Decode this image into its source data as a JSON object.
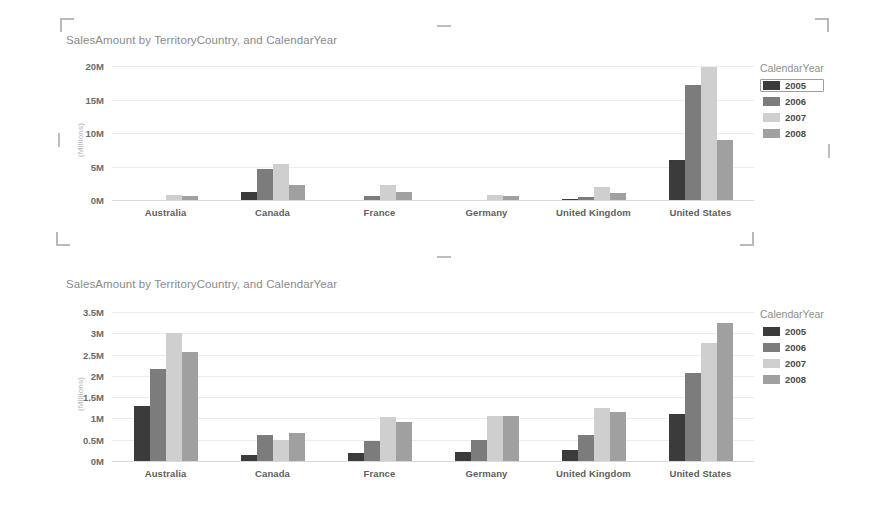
{
  "charts": [
    {
      "id": "top",
      "title": "SalesAmount by TerritoryCountry, and CalendarYear",
      "y_axis_title": "(Millions)",
      "legend_title": "CalendarYear",
      "selected_legend": "2005",
      "chart_data": {
        "type": "bar",
        "title": "SalesAmount by TerritoryCountry, and CalendarYear",
        "xlabel": "",
        "ylabel": "(Millions)",
        "ylim": [
          0,
          20
        ],
        "yticks": [
          "0M",
          "5M",
          "10M",
          "15M",
          "20M"
        ],
        "ytick_values": [
          0,
          5,
          10,
          15,
          20
        ],
        "grid": true,
        "legend_position": "right",
        "categories": [
          "Australia",
          "Canada",
          "France",
          "Germany",
          "United Kingdom",
          "United States"
        ],
        "series": [
          {
            "name": "2005",
            "color": "#3b3b3b",
            "values": [
              0.0,
              1.2,
              0.0,
              0.0,
              0.2,
              6.0
            ]
          },
          {
            "name": "2006",
            "color": "#7c7c7c",
            "values": [
              0.0,
              4.6,
              0.6,
              0.0,
              0.5,
              17.1
            ]
          },
          {
            "name": "2007",
            "color": "#cfcfcf",
            "values": [
              0.7,
              5.4,
              2.2,
              0.8,
              1.9,
              19.9
            ]
          },
          {
            "name": "2008",
            "color": "#a0a0a0",
            "values": [
              0.6,
              2.2,
              1.2,
              0.6,
              1.0,
              8.9
            ]
          }
        ]
      }
    },
    {
      "id": "bottom",
      "title": "SalesAmount by TerritoryCountry, and CalendarYear",
      "y_axis_title": "(Millions)",
      "legend_title": "CalendarYear",
      "selected_legend": "",
      "chart_data": {
        "type": "bar",
        "title": "SalesAmount by TerritoryCountry, and CalendarYear",
        "xlabel": "",
        "ylabel": "(Millions)",
        "ylim": [
          0,
          3.5
        ],
        "yticks": [
          "0M",
          "0.5M",
          "1M",
          "1.5M",
          "2M",
          "2.5M",
          "3M",
          "3.5M"
        ],
        "ytick_values": [
          0,
          0.5,
          1,
          1.5,
          2,
          2.5,
          3,
          3.5
        ],
        "grid": true,
        "legend_position": "right",
        "categories": [
          "Australia",
          "Canada",
          "France",
          "Germany",
          "United Kingdom",
          "United States"
        ],
        "series": [
          {
            "name": "2005",
            "color": "#3b3b3b",
            "values": [
              1.3,
              0.15,
              0.2,
              0.22,
              0.26,
              1.1
            ]
          },
          {
            "name": "2006",
            "color": "#7c7c7c",
            "values": [
              2.15,
              0.6,
              0.48,
              0.5,
              0.6,
              2.07
            ]
          },
          {
            "name": "2007",
            "color": "#cfcfcf",
            "values": [
              3.0,
              0.5,
              1.03,
              1.05,
              1.25,
              2.78
            ]
          },
          {
            "name": "2008",
            "color": "#a0a0a0",
            "values": [
              2.55,
              0.65,
              0.92,
              1.06,
              1.15,
              3.25
            ]
          }
        ]
      }
    }
  ],
  "selection_handles": {
    "corner_color": "#bdbdbd",
    "visible": true
  }
}
